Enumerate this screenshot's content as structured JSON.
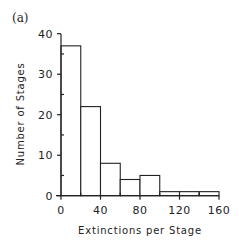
{
  "panel_label": "(a)",
  "chart_data": {
    "type": "bar",
    "subtype": "histogram",
    "title": "",
    "panel_label": "(a)",
    "xlabel": "Extinctions per Stage",
    "ylabel": "Number of Stages",
    "bin_edges": [
      0,
      20,
      40,
      60,
      80,
      100,
      120,
      140,
      160
    ],
    "categories": [
      "0-20",
      "20-40",
      "40-60",
      "60-80",
      "80-100",
      "100-120",
      "120-140",
      "140-160"
    ],
    "values": [
      37,
      22,
      8,
      4,
      5,
      1,
      1,
      1
    ],
    "xlim": [
      0,
      160
    ],
    "ylim": [
      0,
      40
    ],
    "xticks": [
      0,
      40,
      80,
      120,
      160
    ],
    "yticks": [
      0,
      10,
      20,
      30,
      40
    ],
    "grid": false,
    "legend": null,
    "bar_fill": "#ffffff",
    "bar_stroke": "#222222"
  }
}
